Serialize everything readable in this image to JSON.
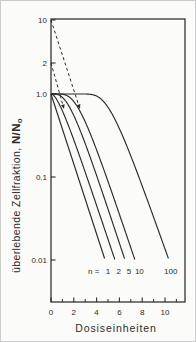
{
  "figure": {
    "language": "German"
  },
  "colors": {
    "ink": "#2b2b2b",
    "background": "#fbfbf9",
    "border": "#cccccc"
  },
  "chart_data": {
    "type": "line",
    "title": "",
    "xlabel": "Dosiseinheiten",
    "ylabel": "überlebende Zellfraktion, N/N₀",
    "ylabel_parts": {
      "prefix": "überlebende Zellfraktion,  ",
      "ratio": "N/N",
      "subscript": "o"
    },
    "x_axis": {
      "major_ticks": [
        0,
        2,
        4,
        6,
        8,
        10
      ],
      "major_tick_labels": [
        "0",
        "2",
        "4",
        "6",
        "8",
        "10"
      ],
      "minor_ticks": [
        1,
        3,
        5,
        7,
        9,
        11
      ],
      "range": [
        0,
        11.75
      ],
      "grid": false
    },
    "y_axis": {
      "scale": "log",
      "ticks": [
        {
          "label": "10",
          "value": 10
        },
        {
          "label": "2",
          "value": 2
        },
        {
          "label": "1.0",
          "value": 1
        },
        {
          "label": "0.1",
          "value": 0.1
        },
        {
          "label": "0.01",
          "value": 0.01
        }
      ],
      "range": [
        0.01,
        10
      ],
      "grid": false
    },
    "series": [
      {
        "name": "n = 1",
        "n": 1,
        "D0": 1.03,
        "points": [
          [
            0,
            1
          ],
          [
            1,
            0.38
          ],
          [
            2,
            0.14
          ],
          [
            3,
            0.054
          ],
          [
            4,
            0.021
          ],
          [
            4.74,
            0.01
          ]
        ]
      },
      {
        "name": "n = 2",
        "n": 2,
        "D0": 1.06,
        "points": [
          [
            0,
            1
          ],
          [
            1,
            0.63
          ],
          [
            2,
            0.28
          ],
          [
            3,
            0.11
          ],
          [
            4,
            0.046
          ],
          [
            5,
            0.018
          ],
          [
            5.61,
            0.01
          ]
        ]
      },
      {
        "name": "n = 5",
        "n": 5,
        "D0": 1.045,
        "points": [
          [
            0,
            1
          ],
          [
            1,
            0.91
          ],
          [
            2,
            0.55
          ],
          [
            3,
            0.25
          ],
          [
            4,
            0.1
          ],
          [
            5,
            0.041
          ],
          [
            6,
            0.016
          ],
          [
            6.49,
            0.01
          ]
        ]
      },
      {
        "name": "n = 10",
        "n": 10,
        "D0": 1.067,
        "points": [
          [
            0,
            1
          ],
          [
            1,
            0.99
          ],
          [
            2,
            0.81
          ],
          [
            3,
            0.46
          ],
          [
            4,
            0.21
          ],
          [
            5,
            0.088
          ],
          [
            6,
            0.035
          ],
          [
            7,
            0.014
          ],
          [
            7.37,
            0.01
          ]
        ]
      },
      {
        "name": "n = 100",
        "n": 100,
        "D0": 1.124,
        "points": [
          [
            0,
            1
          ],
          [
            2,
            1.0
          ],
          [
            3,
            0.999
          ],
          [
            4,
            0.94
          ],
          [
            5,
            0.69
          ],
          [
            6,
            0.38
          ],
          [
            7,
            0.18
          ],
          [
            8,
            0.078
          ],
          [
            9,
            0.033
          ],
          [
            10,
            0.014
          ],
          [
            10.35,
            0.01
          ]
        ]
      }
    ],
    "curve_labels": {
      "prefix": "n =",
      "entries": [
        {
          "text": "1",
          "dose": 5.0
        },
        {
          "text": "2",
          "dose": 5.95
        },
        {
          "text": "5",
          "dose": 6.85
        },
        {
          "text": "10",
          "dose": 7.75
        },
        {
          "text": "100",
          "dose": 10.5
        }
      ]
    },
    "annotations": {
      "style": "dashed-arrow",
      "extrapolation_arrows": [
        {
          "y_intercept": 10,
          "tip_dose": 2.54,
          "tip_survival": 0.66
        },
        {
          "y_intercept": 2,
          "tip_dose": 1.14,
          "tip_survival": 0.66
        }
      ]
    }
  }
}
